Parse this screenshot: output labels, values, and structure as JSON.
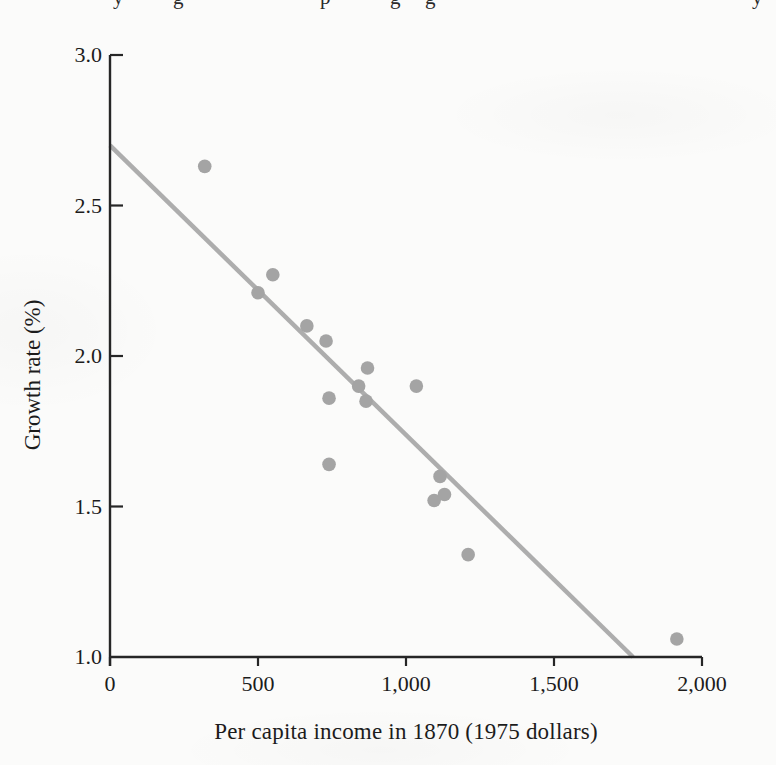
{
  "page": {
    "top_clipped_fragments": [
      {
        "x": 113,
        "glyph": "y"
      },
      {
        "x": 173,
        "glyph": "g"
      },
      {
        "x": 320,
        "glyph": "p"
      },
      {
        "x": 390,
        "glyph": "g"
      },
      {
        "x": 425,
        "glyph": "g"
      },
      {
        "x": 752,
        "glyph": "y"
      }
    ]
  },
  "chart_data": {
    "type": "scatter",
    "title": "",
    "xlabel": "Per capita income in 1870 (1975 dollars)",
    "ylabel": "Growth rate (%)",
    "xlim": [
      0,
      2000
    ],
    "ylim": [
      1.0,
      3.0
    ],
    "grid": false,
    "legend_position": "none",
    "xticks": [
      {
        "value": 0,
        "label": "0"
      },
      {
        "value": 500,
        "label": "500"
      },
      {
        "value": 1000,
        "label": "1,000"
      },
      {
        "value": 1500,
        "label": "1,500"
      },
      {
        "value": 2000,
        "label": "2,000"
      }
    ],
    "yticks": [
      {
        "value": 1.0,
        "label": "1.0"
      },
      {
        "value": 1.5,
        "label": "1.5"
      },
      {
        "value": 2.0,
        "label": "2.0"
      },
      {
        "value": 2.5,
        "label": "2.5"
      },
      {
        "value": 3.0,
        "label": "3.0"
      }
    ],
    "points": [
      {
        "x": 320,
        "y": 2.63
      },
      {
        "x": 500,
        "y": 2.21
      },
      {
        "x": 550,
        "y": 2.27
      },
      {
        "x": 665,
        "y": 2.1
      },
      {
        "x": 730,
        "y": 2.05
      },
      {
        "x": 740,
        "y": 1.86
      },
      {
        "x": 740,
        "y": 1.64
      },
      {
        "x": 840,
        "y": 1.9
      },
      {
        "x": 865,
        "y": 1.85
      },
      {
        "x": 870,
        "y": 1.96
      },
      {
        "x": 1035,
        "y": 1.9
      },
      {
        "x": 1095,
        "y": 1.52
      },
      {
        "x": 1115,
        "y": 1.6
      },
      {
        "x": 1130,
        "y": 1.54
      },
      {
        "x": 1210,
        "y": 1.34
      },
      {
        "x": 1915,
        "y": 1.06
      }
    ],
    "trendline": {
      "x1": 0,
      "y1": 2.7,
      "x2": 1767,
      "y2": 1.0
    },
    "colors": {
      "point": "#a4a4a4",
      "trend_line": "#adadad",
      "axis": "#262626",
      "text": "#1c1c1c",
      "background": "#fbfbfa"
    }
  }
}
